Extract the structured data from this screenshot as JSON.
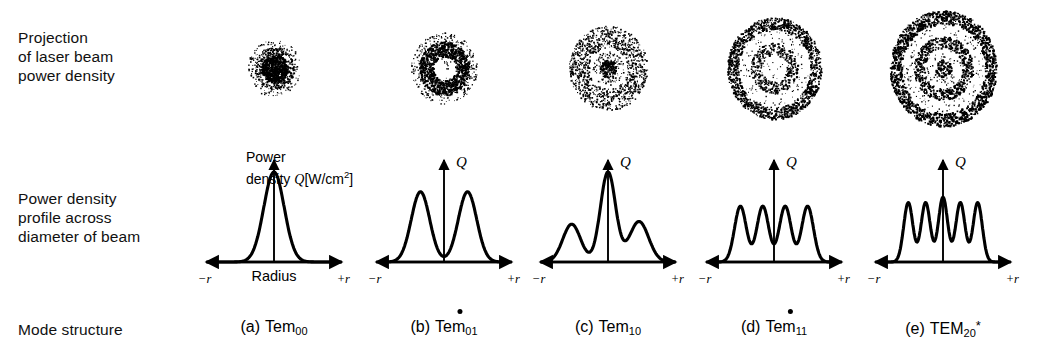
{
  "row_labels": {
    "projection": "Projection\nof laser beam\npower density",
    "profile": "Power density\nprofile across\ndiameter of beam",
    "mode": "Mode structure"
  },
  "axis": {
    "negative": "−r",
    "positive": "+r",
    "radius": "Radius",
    "q_symbol": "Q",
    "power_caption_line1": "Power",
    "power_caption_line2_prefix": "density ",
    "power_caption_q": "Q",
    "power_caption_units": "[W/cm",
    "power_caption_exp": "2",
    "power_caption_close": "]"
  },
  "columns": [
    {
      "id": "a",
      "paren": "(a)",
      "mode_name": "Tem",
      "mode_sub": "00",
      "overdot": false,
      "star": false,
      "spot": "filled-disc",
      "profile_caption": "gaussian single central peak"
    },
    {
      "id": "b",
      "paren": "(b)",
      "mode_name": "Tem",
      "mode_sub": "01",
      "overdot": true,
      "star": false,
      "spot": "single-ring-hollow",
      "profile_caption": "two peaks with central dip"
    },
    {
      "id": "c",
      "paren": "(c)",
      "mode_name": "Tem",
      "mode_sub": "10",
      "overdot": false,
      "star": false,
      "spot": "dot-and-ring",
      "profile_caption": "tall central peak with two side lobes"
    },
    {
      "id": "d",
      "paren": "(d)",
      "mode_name": "Tem",
      "mode_sub": "11",
      "overdot": true,
      "star": false,
      "spot": "two-rings-hollow",
      "profile_caption": "four equal peaks with central dip"
    },
    {
      "id": "e",
      "paren": "(e)",
      "mode_name": "TEM",
      "mode_sub": "20",
      "overdot": false,
      "star": true,
      "spot": "bullseye-dot-two-rings",
      "profile_caption": "five peaks including central peak"
    }
  ],
  "chart_data": {
    "type": "line",
    "xlabel": "Radius",
    "ylabel": "Power density Q [W/cm^2]",
    "xlim": [
      -1,
      1
    ],
    "ylim": [
      0,
      1
    ],
    "grid": false,
    "legend": "none",
    "xtick_labels": [
      "−r",
      "+r"
    ],
    "series": [
      {
        "name": "(a) Tem00",
        "peaks": 1,
        "peak_positions": [
          0.0
        ],
        "peak_heights": [
          1.0
        ],
        "description": "single centered gaussian peak, tails reaching baseline"
      },
      {
        "name": "(b) Tem01*",
        "peaks": 2,
        "peak_positions": [
          -0.42,
          0.42
        ],
        "peak_heights": [
          0.78,
          0.78
        ],
        "center_value": 0.06,
        "description": "donut mode, two symmetric peaks with deep central dip"
      },
      {
        "name": "(c) Tem10",
        "peaks": 3,
        "peak_positions": [
          -0.55,
          0.0,
          0.46
        ],
        "peak_heights": [
          0.42,
          1.0,
          0.45
        ],
        "description": "tall central peak flanked by two lower side lobes"
      },
      {
        "name": "(d) Tem11*",
        "peaks": 4,
        "peak_positions": [
          -0.6,
          -0.2,
          0.2,
          0.6
        ],
        "peak_heights": [
          0.62,
          0.62,
          0.62,
          0.62
        ],
        "center_value": 0.2,
        "description": "four equal-height peaks with dip at center"
      },
      {
        "name": "(e) TEM20*",
        "peaks": 5,
        "peak_positions": [
          -0.62,
          -0.31,
          0.0,
          0.31,
          0.62
        ],
        "peak_heights": [
          0.68,
          0.68,
          0.72,
          0.68,
          0.68
        ],
        "description": "five peaks with a peak at the center"
      }
    ]
  }
}
